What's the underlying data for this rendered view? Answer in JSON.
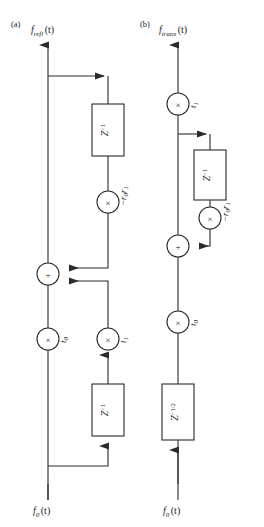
{
  "figure": {
    "background_color": "#ffffff",
    "line_color": "#2b2b2b",
    "panels": [
      {
        "tag": "(a)",
        "output_label": {
          "base": "f",
          "subscript": "refl",
          "argument": "(t)"
        },
        "input_label": {
          "base": "f",
          "subscript": "0",
          "argument": "(t)"
        },
        "multipliers": [
          {
            "glyph": "×",
            "label": "−r",
            "label_sub": "0",
            "label_tail": "r",
            "label_tail_sub": "1",
            "name": "reflection-coefficient"
          },
          {
            "glyph": "×",
            "label": "t",
            "label_sub": "0",
            "name": "transmission-t0"
          },
          {
            "glyph": "×",
            "label": "t",
            "label_sub": "1",
            "name": "transmission-t1"
          }
        ],
        "adders": [
          {
            "glyph": "+"
          }
        ],
        "delays": [
          {
            "base": "Z",
            "exponent": "−1"
          },
          {
            "base": "Z",
            "exponent": "−1"
          }
        ]
      },
      {
        "tag": "(b)",
        "output_label": {
          "base": "f",
          "subscript": "trans",
          "argument": "(t)"
        },
        "input_label": {
          "base": "f",
          "subscript": "0",
          "argument": "(t)"
        },
        "multipliers": [
          {
            "glyph": "×",
            "label": "t",
            "label_sub": "1",
            "name": "transmission-t1"
          },
          {
            "glyph": "×",
            "label": "−r",
            "label_sub": "0",
            "label_tail": "r",
            "label_tail_sub": "1",
            "name": "reflection-coefficient"
          },
          {
            "glyph": "×",
            "label": "t",
            "label_sub": "0",
            "name": "transmission-t0"
          }
        ],
        "adders": [
          {
            "glyph": "+"
          }
        ],
        "delays": [
          {
            "base": "Z",
            "exponent": "−1"
          },
          {
            "base": "Z",
            "exponent": "−1/2"
          }
        ]
      }
    ]
  }
}
